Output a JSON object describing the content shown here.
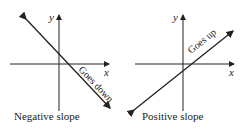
{
  "panels": [
    {
      "caption": "Negative slope",
      "x_label": "x",
      "y_label": "y",
      "line_label": "Goes down"
    },
    {
      "caption": "Positive slope",
      "x_label": "x",
      "y_label": "y",
      "line_label": "Goes up"
    }
  ],
  "colors": {
    "ink": "#222222",
    "background": "#ffffff"
  }
}
